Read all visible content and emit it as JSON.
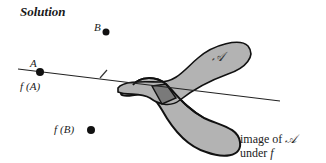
{
  "title": "Solution",
  "points": {
    "A": {
      "label": "A",
      "x": 40,
      "y": 72
    },
    "B": {
      "label": "B",
      "x": 106,
      "y": 32
    },
    "fB": {
      "x": 91,
      "y": 130
    }
  },
  "labels": {
    "line": "ℓ",
    "fA": "f",
    "fA_arg": "(A)",
    "fB": "f",
    "fB_arg": "(B)",
    "set": "𝒜",
    "caption_line1": "image of",
    "caption_set": "𝒜",
    "caption_line2": "under",
    "caption_f": "f"
  },
  "colors": {
    "fill": "#b3b3b3",
    "overlap": "#7a7a7a",
    "stroke": "#111111",
    "line": "#222222"
  }
}
